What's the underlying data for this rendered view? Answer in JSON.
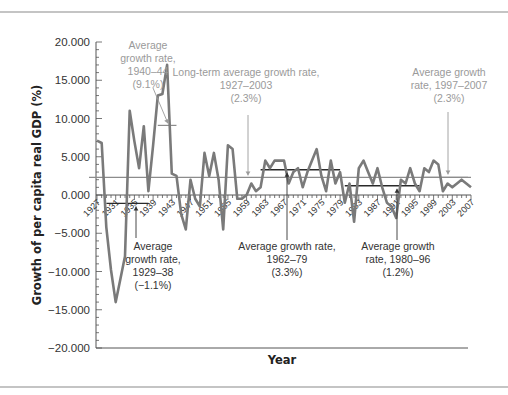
{
  "chart_data": {
    "type": "line",
    "title": "",
    "xlabel": "Year",
    "ylabel": "Growth of per capita real GDP (%)",
    "xlim": [
      1927,
      2007
    ],
    "ylim": [
      -20,
      20
    ],
    "grid": false,
    "ytick_labels": [
      "20.000",
      "15.000",
      "10.000",
      "5.000",
      "0.000",
      "-5.000",
      "-10.000",
      "-15.000",
      "-20.000"
    ],
    "ytick_values": [
      20,
      15,
      10,
      5,
      0,
      -5,
      -10,
      -15,
      -20
    ],
    "xtick_labels": [
      "1927",
      "1931",
      "1935",
      "1939",
      "1943",
      "1947",
      "1951",
      "1955",
      "1959",
      "1963",
      "1967",
      "1971",
      "1975",
      "1979",
      "1983",
      "1987",
      "1991",
      "1995",
      "1999",
      "2003",
      "2007"
    ],
    "series": [
      {
        "name": "Growth of per capita real GDP",
        "x": [
          1927,
          1928,
          1929,
          1930,
          1931,
          1932,
          1933,
          1934,
          1935,
          1936,
          1937,
          1938,
          1939,
          1940,
          1941,
          1942,
          1943,
          1944,
          1945,
          1946,
          1947,
          1948,
          1949,
          1950,
          1951,
          1952,
          1953,
          1954,
          1955,
          1956,
          1957,
          1958,
          1959,
          1960,
          1961,
          1962,
          1963,
          1964,
          1965,
          1966,
          1967,
          1968,
          1969,
          1970,
          1971,
          1972,
          1973,
          1974,
          1975,
          1976,
          1977,
          1978,
          1979,
          1980,
          1981,
          1982,
          1983,
          1984,
          1985,
          1986,
          1987,
          1988,
          1989,
          1990,
          1991,
          1992,
          1993,
          1994,
          1995,
          1996,
          1997,
          1998,
          1999,
          2000,
          2001,
          2002,
          2003,
          2004,
          2005,
          2006,
          2007
        ],
        "values": [
          7.1,
          6.8,
          -4.2,
          -9.8,
          -14.0,
          -11.0,
          -8.0,
          11.0,
          7.0,
          3.5,
          9.0,
          0.5,
          6.5,
          13.0,
          13.2,
          17.0,
          2.8,
          2.5,
          -2.5,
          -4.5,
          2.0,
          -0.5,
          -1.5,
          5.5,
          2.5,
          5.5,
          2.0,
          -4.5,
          6.5,
          6.0,
          -0.5,
          -0.5,
          0.0,
          1.5,
          0.5,
          1.0,
          4.5,
          3.5,
          4.5,
          4.5,
          4.5,
          1.5,
          3.0,
          3.5,
          1.0,
          3.0,
          4.5,
          6.0,
          2.5,
          0.5,
          4.5,
          1.5,
          3.0,
          -1.0,
          1.5,
          -3.5,
          3.5,
          4.5,
          3.0,
          1.5,
          3.5,
          1.0,
          -1.0,
          -1.5,
          -3.0,
          2.0,
          1.5,
          3.5,
          1.5,
          0.5,
          3.5,
          3.0,
          4.5,
          4.0,
          0.5,
          1.5,
          1.0,
          1.5,
          2.0,
          1.5,
          1.0
        ]
      }
    ],
    "average_lines": [
      {
        "label_lines": [
          "Average",
          "growth rate,",
          "1940–44",
          "(9.1%)"
        ],
        "start": 1940,
        "end": 1944,
        "value": 9.1,
        "style": "gray"
      },
      {
        "label_lines": [
          "Long-term average growth rate,",
          "1927–2003",
          "(2.3%)"
        ],
        "start": 1927,
        "end": 2007,
        "value": 2.3,
        "style": "gray"
      },
      {
        "label_lines": [
          "Average growth",
          "rate, 1997–2007",
          "(2.3%)"
        ],
        "start": 1997,
        "end": 2007,
        "value": 2.3,
        "style": "gray"
      },
      {
        "label_lines": [
          "Average",
          "growth rate,",
          "1929–38",
          "(−1.1%)"
        ],
        "start": 1929,
        "end": 1938,
        "value": -1.1,
        "style": "dark"
      },
      {
        "label_lines": [
          "Average growth rate,",
          "1962–79",
          "(3.3%)"
        ],
        "start": 1962,
        "end": 1979,
        "value": 3.3,
        "style": "dark"
      },
      {
        "label_lines": [
          "Average growth",
          "rate, 1980–96",
          "(1.2%)"
        ],
        "start": 1980,
        "end": 1996,
        "value": 1.2,
        "style": "dark"
      }
    ]
  }
}
